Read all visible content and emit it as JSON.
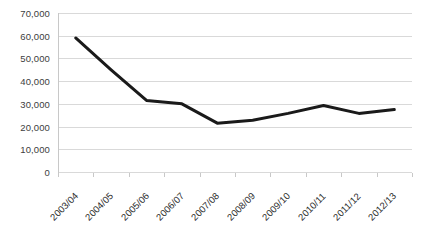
{
  "chart_data": {
    "type": "line",
    "title": "",
    "subtitle": "",
    "xlabel": "",
    "ylabel": "",
    "categories": [
      "2003/04",
      "2004/05",
      "2005/06",
      "2006/07",
      "2007/08",
      "2008/09",
      "2009/10",
      "2010/11",
      "2011/12",
      "2012/13"
    ],
    "values": [
      59000,
      45000,
      31500,
      30000,
      21500,
      22800,
      25800,
      29300,
      25800,
      27500
    ],
    "series": [
      {
        "name": "",
        "values": [
          59000,
          45000,
          31500,
          30000,
          21500,
          22800,
          25800,
          29300,
          25800,
          27500
        ]
      }
    ],
    "ylim": [
      0,
      70000
    ],
    "ytick_values": [
      0,
      10000,
      20000,
      30000,
      40000,
      50000,
      60000,
      70000
    ],
    "ytick_labels": [
      "0",
      "10,000",
      "20,000",
      "30,000",
      "40,000",
      "50,000",
      "60,000",
      "70,000"
    ],
    "grid": "horizontal",
    "legend": "none",
    "line_color": "#1a1a1a",
    "line_width": 3,
    "gridline_color": "#d9d9d9",
    "background_color": "#ffffff",
    "axis_label_color": "#404040",
    "markers": "none",
    "annotations": []
  },
  "axis": {
    "y_top_label": "70,000",
    "y_zero_label": "0",
    "x_first_label": "2003/04",
    "x_last_label": "2012/13"
  }
}
